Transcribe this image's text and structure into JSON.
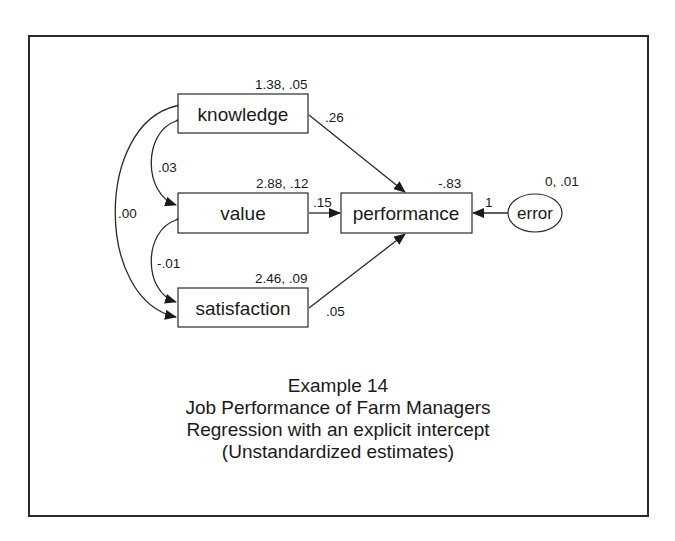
{
  "diagram": {
    "type": "path-diagram",
    "nodes": {
      "knowledge": {
        "label": "knowledge",
        "shape": "rectangle",
        "params": "1.38, .05"
      },
      "value": {
        "label": "value",
        "shape": "rectangle",
        "params": "2.88, .12"
      },
      "satisfaction": {
        "label": "satisfaction",
        "shape": "rectangle",
        "params": "2.46, .09"
      },
      "performance": {
        "label": "performance",
        "shape": "rectangle",
        "params": "-.83"
      },
      "error": {
        "label": "error",
        "shape": "ellipse",
        "params": "0, .01"
      }
    },
    "paths": {
      "knowledge_to_performance": {
        "from": "knowledge",
        "to": "performance",
        "weight": ".26"
      },
      "value_to_performance": {
        "from": "value",
        "to": "performance",
        "weight": ".15"
      },
      "satisfaction_to_performance": {
        "from": "satisfaction",
        "to": "performance",
        "weight": ".05"
      },
      "error_to_performance": {
        "from": "error",
        "to": "performance",
        "weight": "1"
      }
    },
    "covariances": {
      "knowledge_value": {
        "between": [
          "knowledge",
          "value"
        ],
        "value": ".03"
      },
      "value_satisfaction": {
        "between": [
          "value",
          "satisfaction"
        ],
        "value": "-.01"
      },
      "knowledge_satisfaction": {
        "between": [
          "knowledge",
          "satisfaction"
        ],
        "value": ".00"
      }
    },
    "caption": {
      "line1": "Example 14",
      "line2": "Job Performance of Farm Managers",
      "line3": "Regression with an explicit intercept",
      "line4": "(Unstandardized estimates)"
    }
  }
}
